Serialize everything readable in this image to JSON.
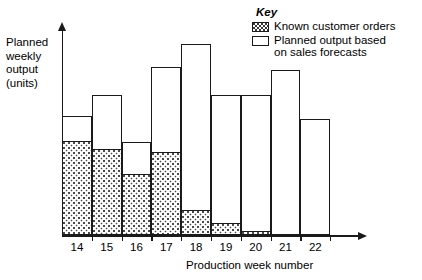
{
  "chart_data": {
    "type": "bar",
    "subtype": "stacked",
    "title": "",
    "xlabel": "Production week number",
    "ylabel": "Planned weekly output (units)",
    "categories": [
      "14",
      "15",
      "16",
      "17",
      "18",
      "19",
      "20",
      "21",
      "22"
    ],
    "series": [
      {
        "name": "Known customer orders",
        "fill": "dotted-hatch",
        "values": [
          94,
          86,
          61,
          83,
          25,
          12,
          4,
          0,
          0
        ]
      },
      {
        "name": "Planned output based on sales forecasts",
        "fill": "white",
        "values": [
          25,
          54,
          32,
          85,
          166,
          128,
          136,
          165,
          116
        ]
      }
    ],
    "totals": [
      119,
      140,
      93,
      168,
      191,
      140,
      140,
      165,
      116
    ],
    "ylim": [
      0,
      206
    ],
    "grid": false,
    "axis_ticks_y": false,
    "legend_position": "top-right"
  },
  "axes": {
    "y_label_lines": [
      "Planned",
      "weekly",
      "output",
      "(units)"
    ],
    "x_title": "Production week number"
  },
  "legend": {
    "title": "Key",
    "items": [
      {
        "label_lines": [
          "Known customer orders"
        ],
        "swatch": "known"
      },
      {
        "label_lines": [
          "Planned output based",
          "on sales forecasts"
        ],
        "swatch": "planned"
      }
    ]
  },
  "colors": {
    "ink": "#1a1a1a",
    "background": "#ffffff",
    "hatch": "#4a4a4a"
  }
}
